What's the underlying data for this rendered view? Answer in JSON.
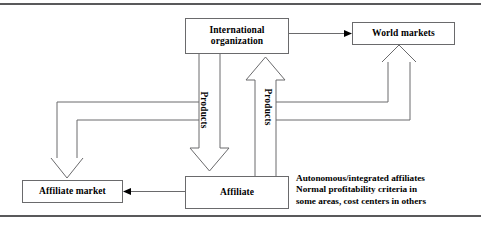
{
  "figure": {
    "stroke_color": "#6a6a6c",
    "rule_color": "#59595b",
    "background": "#ffffff"
  },
  "nodes": {
    "international": {
      "label": "International\norganization",
      "line1": "International",
      "line2": "organization"
    },
    "world_markets": {
      "label": "World markets"
    },
    "affiliate": {
      "label": "Affiliate"
    },
    "affiliate_market": {
      "label": "Affiliate market"
    }
  },
  "edges": {
    "products_down": {
      "label": "Products",
      "direction": "down",
      "from": "international",
      "to": "affiliate"
    },
    "products_up": {
      "label": "Products",
      "direction": "up",
      "from": "affiliate",
      "to": "international"
    },
    "org_to_world": {
      "label": "",
      "direction": "right",
      "from": "international",
      "to": "world_markets"
    },
    "affiliate_to_market": {
      "label": "",
      "direction": "left",
      "from": "affiliate",
      "to": "affiliate_market"
    },
    "products_down_to_market_1": {
      "label": "",
      "direction": "down-left",
      "from": "products_down",
      "to": "affiliate_market"
    },
    "products_down_to_market_2": {
      "label": "",
      "direction": "down-left",
      "from": "products_down",
      "to": "affiliate_market"
    },
    "products_up_to_world_1": {
      "label": "",
      "direction": "up-right",
      "from": "products_up",
      "to": "world_markets"
    },
    "products_up_to_world_2": {
      "label": "",
      "direction": "up-right",
      "from": "products_up",
      "to": "world_markets"
    }
  },
  "note": {
    "line1": "Autonomous/integrated affiliates",
    "line2": "Normal profitability criteria in",
    "line3": "some areas, cost centers in others"
  }
}
